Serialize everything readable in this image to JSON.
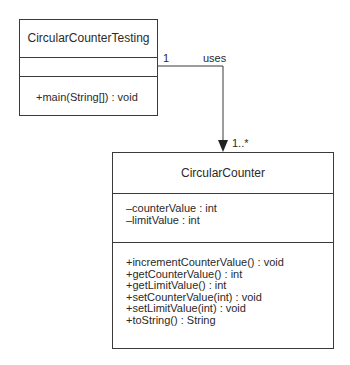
{
  "classes": {
    "testing": {
      "name": "CircularCounterTesting",
      "attributes": [],
      "operations": [
        "+main(String[]) : void"
      ]
    },
    "counter": {
      "name": "CircularCounter",
      "attributes": [
        "–counterValue : int",
        "–limitValue : int"
      ],
      "operations": [
        "+incrementCounterValue() : void",
        "+getCounterValue() : int",
        "+getLimitValue() : int",
        "+setCounterValue(int) : void",
        "+setLimitValue(int) : void",
        "+toString() : String"
      ]
    }
  },
  "association": {
    "label": "uses",
    "source_multiplicity": "1",
    "target_multiplicity": "1..*",
    "line_color": "#3a3a3a"
  }
}
